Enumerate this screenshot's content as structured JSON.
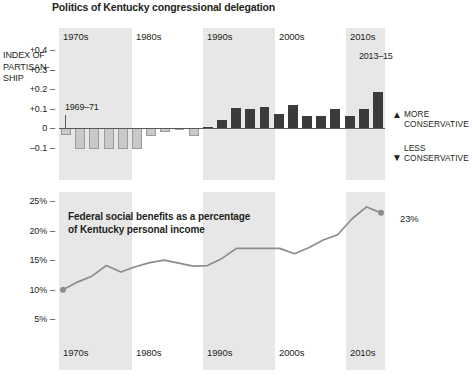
{
  "figure": {
    "title": "Politics of Kentucky congressional delegation"
  },
  "chart_data": [
    {
      "type": "bar",
      "title": "Politics of Kentucky congressional delegation",
      "ylabel": "INDEX OF PARTISAN-SHIP",
      "ylabel_lines": [
        "INDEX OF",
        "PARTISAN-",
        "SHIP"
      ],
      "xlabel": "",
      "ylim": [
        -0.13,
        0.47
      ],
      "yticks": [
        0.4,
        0.3,
        0.2,
        0.1,
        0,
        -0.1
      ],
      "ytick_labels": [
        "+0.4",
        "+0.3",
        "+0.2",
        "+0.1",
        "0",
        "–0.1"
      ],
      "grid": false,
      "categories": [
        "1969–71",
        "1971–73",
        "1973–75",
        "1975–77",
        "1977–79",
        "1979–81",
        "1981–83",
        "1983–85",
        "1985–87",
        "1987–89",
        "1989–91",
        "1991–93",
        "1993–95",
        "1995–97",
        "1997–99",
        "1999–01",
        "2001–03",
        "2003–05",
        "2005–07",
        "2007–09",
        "2009–11",
        "2011–13",
        "2013–15"
      ],
      "values": [
        -0.035,
        -0.105,
        -0.105,
        -0.105,
        -0.105,
        -0.105,
        -0.04,
        -0.018,
        -0.002,
        -0.038,
        0.006,
        0.045,
        0.105,
        0.1,
        0.107,
        0.075,
        0.12,
        0.063,
        0.065,
        0.1,
        0.062,
        0.1,
        0.185
      ],
      "annotations": [
        {
          "text": "1969–71",
          "target_category": "1969–71"
        },
        {
          "text": "2013–15",
          "target_category": "2013–15"
        },
        {
          "text": "MORE CONSERVATIVE",
          "direction": "up"
        },
        {
          "text": "LESS CONSERVATIVE",
          "direction": "down"
        }
      ],
      "decade_bands": [
        "1970s",
        "1990s",
        "2010s"
      ],
      "decade_ticks": [
        "1970s",
        "1980s",
        "1990s",
        "2000s",
        "2010s"
      ]
    },
    {
      "type": "line",
      "title": "Federal social benefits as a percentage of Kentucky personal income",
      "title_lines": [
        "Federal social benefits as a percentage",
        "of Kentucky personal income"
      ],
      "ylabel": "",
      "xlabel": "",
      "ylim": [
        4,
        26
      ],
      "yticks": [
        25,
        20,
        15,
        10,
        5
      ],
      "ytick_labels": [
        "25%",
        "20%",
        "15%",
        "10%",
        "5%"
      ],
      "grid": false,
      "x": [
        1970,
        1972,
        1974,
        1976,
        1978,
        1980,
        1982,
        1984,
        1986,
        1988,
        1990,
        1992,
        1994,
        1996,
        1998,
        2000,
        2002,
        2004,
        2006,
        2008,
        2010,
        2012,
        2014
      ],
      "values": [
        10.0,
        11.3,
        12.3,
        14.1,
        13.0,
        13.9,
        14.6,
        15.0,
        14.5,
        14.0,
        14.1,
        15.3,
        17.0,
        17.0,
        17.0,
        17.0,
        16.1,
        17.1,
        18.4,
        19.3,
        22.0,
        24.0,
        23.0
      ],
      "endpoint_label": "23%",
      "start_marker_value": 10.0,
      "end_marker_value": 23.0,
      "decade_bands": [
        "1970s",
        "1990s",
        "2010s"
      ],
      "decade_ticks": [
        "1970s",
        "1980s",
        "1990s",
        "2000s",
        "2010s"
      ],
      "line_color": "#8c8c8c"
    }
  ],
  "colors": {
    "band_shade": "#e7e7e7",
    "bar_negative": "#c9c9c9",
    "bar_positive": "#3b3b3b",
    "line": "#8c8c8c",
    "text": "#231f20",
    "axis": "#58595b"
  },
  "axis_top": {
    "title_lines": [
      "INDEX OF",
      "PARTISAN-",
      "SHIP"
    ],
    "ticks": [
      "+0.4",
      "+0.3",
      "+0.2",
      "+0.1",
      "0",
      "–0.1"
    ]
  },
  "axis_bottom": {
    "ticks": [
      "25%",
      "20%",
      "15%",
      "10%",
      "5%"
    ]
  },
  "decades_top": [
    "1970s",
    "1980s",
    "1990s",
    "2000s",
    "2010s"
  ],
  "decades_bottom": [
    "1970s",
    "1980s",
    "1990s",
    "2000s",
    "2010s"
  ],
  "callouts": {
    "first_congress": "1969–71",
    "last_congress": "2013–15"
  },
  "side_annotations": {
    "more": [
      "MORE",
      "CONSERVATIVE"
    ],
    "less": [
      "LESS",
      "CONSERVATIVE"
    ],
    "more_arrow": "▲",
    "less_arrow": "▼"
  },
  "bottom_title_lines": [
    "Federal social benefits as a percentage",
    "of Kentucky personal income"
  ],
  "bottom_endpoint_label": "23%"
}
